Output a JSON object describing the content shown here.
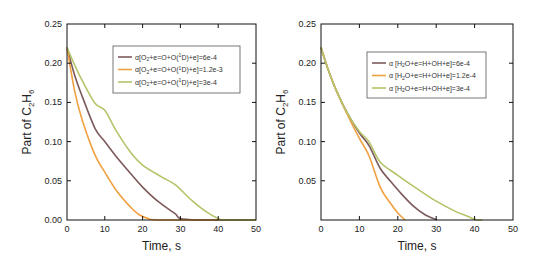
{
  "chart_data": [
    {
      "type": "line",
      "title": "",
      "xlabel": "Time, s",
      "ylabel_main": "Part of C",
      "ylabel_sub1": "2",
      "ylabel_mid": "H",
      "ylabel_sub2": "6",
      "xlim": [
        0,
        50
      ],
      "ylim": [
        0,
        0.25
      ],
      "xticks": [
        0,
        10,
        20,
        30,
        40,
        50
      ],
      "xtick_labels": [
        "0",
        "10",
        "20",
        "30",
        "40",
        "50"
      ],
      "yticks": [
        0,
        0.05,
        0.1,
        0.15,
        0.2,
        0.25
      ],
      "ytick_labels": [
        "0.00",
        "0.05",
        "0.10",
        "0.15",
        "0.20",
        "0.25"
      ],
      "grid": false,
      "legend_position": "top-right",
      "series": [
        {
          "name": "α[O₂+e=O+O(¹D)+e]=6e-4",
          "legend_prefix": "α[O",
          "legend_sub": "2",
          "legend_mid": "+e=O+O(",
          "legend_sup": "1",
          "legend_suffix": "D)+e]=6e-4",
          "color": "#7d5a5c",
          "x": [
            0,
            2,
            4,
            7.4,
            10,
            13,
            16.7,
            20,
            24,
            28.6,
            30,
            35,
            40,
            50
          ],
          "y": [
            0.22,
            0.185,
            0.158,
            0.117,
            0.1,
            0.081,
            0.06,
            0.042,
            0.024,
            0.008,
            0.002,
            0.0,
            0.0,
            0.0
          ]
        },
        {
          "name": "α[O₂+e=O+O(¹D)+e]=1.2e-3",
          "legend_prefix": "α[O",
          "legend_sub": "2",
          "legend_mid": "+e=O+O(",
          "legend_sup": "1",
          "legend_suffix": "D)+e]=1.2e-3",
          "color": "#f0a040",
          "x": [
            0,
            2,
            4,
            7.4,
            10,
            13,
            16.7,
            19,
            22,
            25,
            30,
            40,
            50
          ],
          "y": [
            0.22,
            0.165,
            0.128,
            0.083,
            0.061,
            0.038,
            0.017,
            0.007,
            0.001,
            0.0,
            0.0,
            0.0,
            0.0
          ]
        },
        {
          "name": "α[O₂+e=O+O(¹D)+e]=3e-4",
          "legend_prefix": "α[O",
          "legend_sub": "2",
          "legend_mid": "+e=O+O(",
          "legend_sup": "1",
          "legend_suffix": "D)+e]=3e-4",
          "color": "#b5c46a",
          "x": [
            0,
            2,
            4,
            7.4,
            10,
            13,
            16.7,
            20,
            25,
            28.6,
            33,
            37,
            41,
            45,
            50
          ],
          "y": [
            0.22,
            0.198,
            0.178,
            0.149,
            0.14,
            0.114,
            0.087,
            0.07,
            0.055,
            0.045,
            0.025,
            0.01,
            0.0,
            0.0,
            0.0
          ]
        }
      ]
    },
    {
      "type": "line",
      "title": "",
      "xlabel": "Time, s",
      "ylabel_main": "Part of C",
      "ylabel_sub1": "2",
      "ylabel_mid": "H",
      "ylabel_sub2": "6",
      "xlim": [
        0,
        50
      ],
      "ylim": [
        0,
        0.25
      ],
      "xticks": [
        0,
        10,
        20,
        30,
        40,
        50
      ],
      "xtick_labels": [
        "0",
        "10",
        "20",
        "30",
        "40",
        "50"
      ],
      "yticks": [
        0.05,
        0.1,
        0.15,
        0.2,
        0.25
      ],
      "ytick_labels": [
        "0.05",
        "0.10",
        "0.15",
        "0.20",
        "0.25"
      ],
      "grid": false,
      "legend_position": "top-right",
      "series": [
        {
          "name": "α [H₂O+e=H+OH+e]=6e-4",
          "legend_prefix": "α [H",
          "legend_sub": "2",
          "legend_mid": "O+e=H+OH+e]=6e-4",
          "color": "#7d5a5c",
          "x": [
            0,
            2,
            4,
            7,
            10,
            12.5,
            15.4,
            18,
            21,
            24,
            27,
            30.2
          ],
          "y": [
            0.22,
            0.19,
            0.165,
            0.135,
            0.111,
            0.095,
            0.066,
            0.05,
            0.033,
            0.018,
            0.007,
            0.0
          ]
        },
        {
          "name": "α [H₂O+e=H+OH+e]=1.2e-4",
          "legend_prefix": "α [H",
          "legend_sub": "2",
          "legend_mid": "O+e=H+OH+e]=1.2e-4",
          "color": "#f0a040",
          "x": [
            0,
            2,
            4,
            7,
            10,
            12.5,
            15.4,
            18,
            20,
            21.9
          ],
          "y": [
            0.22,
            0.19,
            0.165,
            0.133,
            0.104,
            0.082,
            0.042,
            0.022,
            0.009,
            0.0
          ]
        },
        {
          "name": "α [H₂O+e=H+OH+e]=3e-4",
          "legend_prefix": "α [H",
          "legend_sub": "2",
          "legend_mid": "O+e=H+OH+e]=3e-4",
          "color": "#b5c46a",
          "x": [
            0,
            2,
            4,
            7,
            10,
            12.5,
            15.4,
            20,
            25,
            30,
            35,
            38,
            40.6,
            42
          ],
          "y": [
            0.22,
            0.19,
            0.165,
            0.135,
            0.113,
            0.1,
            0.074,
            0.057,
            0.04,
            0.024,
            0.011,
            0.005,
            0.0,
            0.0
          ]
        }
      ]
    }
  ]
}
